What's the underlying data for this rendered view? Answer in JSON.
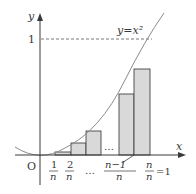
{
  "diagram": {
    "curve_label": "y=x²",
    "axes": {
      "x_label": "x",
      "y_label": "y",
      "origin_label": "O",
      "y_tick_label": "1"
    },
    "x_ticks": [
      {
        "num": "1",
        "den": "n"
      },
      {
        "num": "2",
        "den": "n"
      },
      {
        "num": "n−1",
        "den": "n"
      },
      {
        "num": "n",
        "den": "n",
        "suffix": "=1"
      }
    ],
    "ellipsis_axis": "…",
    "ellipsis_rects": "…",
    "colors": {
      "axis": "#3a3a3a",
      "curve": "#8a8a8a",
      "rect_fill": "#d9d9d9",
      "rect_stroke": "#444444",
      "dashed": "#555555"
    }
  }
}
